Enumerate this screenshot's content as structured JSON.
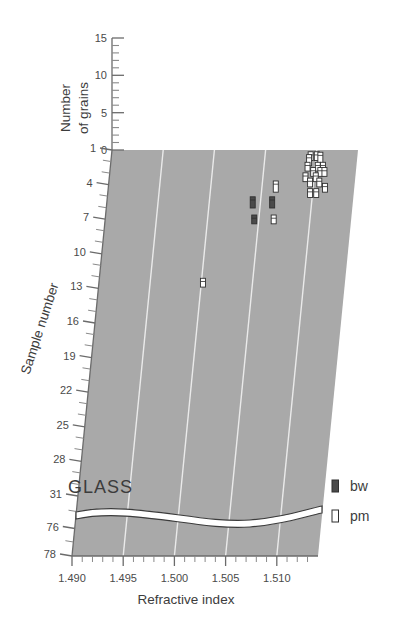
{
  "chart_data": {
    "type": "scatter",
    "title": "",
    "xlabel": "Refractive index",
    "ylabel": "Sample number",
    "zlabel": "Number of grains",
    "plot_annotation": "GLASS",
    "xlim": [
      1.4885,
      1.5125
    ],
    "x_ticks": [
      "1.490",
      "1.495",
      "1.500",
      "1.505",
      "1.510"
    ],
    "x_tick_values": [
      1.49,
      1.495,
      1.5,
      1.505,
      1.51
    ],
    "x_minor_step": 0.001,
    "y_ticks": [
      "1",
      "4",
      "7",
      "10",
      "13",
      "16",
      "19",
      "22",
      "25",
      "28",
      "31",
      "76",
      "78"
    ],
    "y_tick_values": [
      1,
      4,
      7,
      10,
      13,
      16,
      19,
      22,
      25,
      28,
      31,
      76,
      78
    ],
    "y_axis_break_after": 31,
    "z_ticks": [
      "0",
      "5",
      "10",
      "15"
    ],
    "z_tick_values": [
      0,
      5,
      10,
      15
    ],
    "z_minor_step": 1,
    "zlim": [
      0,
      15
    ],
    "grid": true,
    "grid_color": "#ffffff",
    "background": "#a9a9a9",
    "legend_position": "right-bottom",
    "series": [
      {
        "name": "bw",
        "label": "bw",
        "marker": "filled-bar",
        "color": "#4a4a4a",
        "points": [
          {
            "x": 1.5043,
            "y": 12,
            "grains": 3
          },
          {
            "x": 1.5062,
            "y": 12,
            "grains": 3
          },
          {
            "x": 1.5046,
            "y": 15,
            "grains": 2
          }
        ]
      },
      {
        "name": "pm",
        "label": "pm",
        "marker": "open-bar",
        "color": "#ffffff",
        "points": [
          {
            "x": 1.5095,
            "y": 3,
            "grains": 2
          },
          {
            "x": 1.5101,
            "y": 3,
            "grains": 2
          },
          {
            "x": 1.5094,
            "y": 4,
            "grains": 3
          },
          {
            "x": 1.5105,
            "y": 4,
            "grains": 4
          },
          {
            "x": 1.5093,
            "y": 5,
            "grains": 2
          },
          {
            "x": 1.5103,
            "y": 5,
            "grains": 2
          },
          {
            "x": 1.5108,
            "y": 5,
            "grains": 2
          },
          {
            "x": 1.5099,
            "y": 6,
            "grains": 2
          },
          {
            "x": 1.5106,
            "y": 6,
            "grains": 2
          },
          {
            "x": 1.511,
            "y": 6,
            "grains": 2
          },
          {
            "x": 1.5092,
            "y": 7,
            "grains": 2
          },
          {
            "x": 1.5102,
            "y": 7,
            "grains": 2
          },
          {
            "x": 1.5097,
            "y": 8,
            "grains": 2
          },
          {
            "x": 1.5106,
            "y": 8,
            "grains": 2
          },
          {
            "x": 1.5064,
            "y": 9,
            "grains": 3
          },
          {
            "x": 1.5098,
            "y": 10,
            "grains": 2
          },
          {
            "x": 1.5104,
            "y": 10,
            "grains": 2
          },
          {
            "x": 1.5112,
            "y": 9,
            "grains": 2
          },
          {
            "x": 1.5065,
            "y": 15,
            "grains": 2
          },
          {
            "x": 1.5002,
            "y": 27,
            "grains": 2
          }
        ]
      }
    ]
  },
  "axes": {
    "x_axis_title": "Refractive index",
    "y_axis_title": "Sample number",
    "z_axis_title_line1": "Number",
    "z_axis_title_line2": "of grains"
  },
  "legend": {
    "items": [
      {
        "key": "bw",
        "label": "bw"
      },
      {
        "key": "pm",
        "label": "pm"
      }
    ]
  },
  "annotations": {
    "glass": "GLASS"
  }
}
